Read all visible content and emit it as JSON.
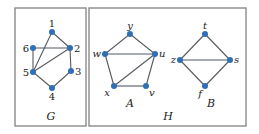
{
  "colors": {
    "node": "#2f6fb5",
    "edge": "#555a60",
    "frame": "#8a8a8a"
  },
  "panels": {
    "G": {
      "label": "G"
    },
    "H": {
      "label": "H"
    }
  },
  "graphs": {
    "G": {
      "label": "G",
      "nodes": [
        {
          "id": "1",
          "label": "1",
          "x": 52,
          "y": 32
        },
        {
          "id": "2",
          "label": "2",
          "x": 70,
          "y": 48
        },
        {
          "id": "3",
          "label": "3",
          "x": 71,
          "y": 71
        },
        {
          "id": "4",
          "label": "4",
          "x": 52,
          "y": 88
        },
        {
          "id": "5",
          "label": "5",
          "x": 33,
          "y": 72
        },
        {
          "id": "6",
          "label": "6",
          "x": 33,
          "y": 48
        }
      ],
      "edges": [
        [
          "1",
          "2"
        ],
        [
          "1",
          "5"
        ],
        [
          "6",
          "2"
        ],
        [
          "6",
          "5"
        ],
        [
          "5",
          "2"
        ],
        [
          "2",
          "3"
        ],
        [
          "3",
          "4"
        ],
        [
          "4",
          "5"
        ]
      ]
    },
    "A": {
      "label": "A",
      "nodes": [
        {
          "id": "y",
          "label": "y",
          "x": 130,
          "y": 34
        },
        {
          "id": "w",
          "label": "w",
          "x": 105,
          "y": 54
        },
        {
          "id": "u",
          "label": "u",
          "x": 155,
          "y": 54
        },
        {
          "id": "x",
          "label": "x",
          "x": 114,
          "y": 86
        },
        {
          "id": "v",
          "label": "v",
          "x": 146,
          "y": 86
        }
      ],
      "edges": [
        [
          "y",
          "w"
        ],
        [
          "y",
          "u"
        ],
        [
          "w",
          "u"
        ],
        [
          "w",
          "x"
        ],
        [
          "x",
          "u"
        ],
        [
          "x",
          "v"
        ],
        [
          "v",
          "u"
        ]
      ]
    },
    "B": {
      "label": "B",
      "nodes": [
        {
          "id": "t",
          "label": "t",
          "x": 205,
          "y": 34
        },
        {
          "id": "z",
          "label": "z",
          "x": 180,
          "y": 60
        },
        {
          "id": "s",
          "label": "s",
          "x": 230,
          "y": 60
        },
        {
          "id": "f",
          "label": "f",
          "x": 205,
          "y": 86
        }
      ],
      "edges": [
        [
          "t",
          "z"
        ],
        [
          "t",
          "s"
        ],
        [
          "z",
          "s"
        ],
        [
          "z",
          "f"
        ],
        [
          "f",
          "s"
        ]
      ]
    }
  }
}
